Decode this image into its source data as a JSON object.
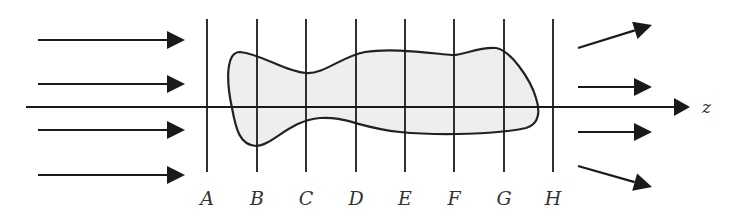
{
  "diagram": {
    "axis": {
      "label": "z",
      "y": 107,
      "x_start": 26,
      "x_end": 690
    },
    "planes": [
      {
        "label": "A",
        "x": 207
      },
      {
        "label": "B",
        "x": 257
      },
      {
        "label": "C",
        "x": 306
      },
      {
        "label": "D",
        "x": 356
      },
      {
        "label": "E",
        "x": 405
      },
      {
        "label": "F",
        "x": 454
      },
      {
        "label": "G",
        "x": 504
      },
      {
        "label": "H",
        "x": 553
      }
    ],
    "plane_top": 19,
    "plane_bottom": 172,
    "label_y": 205,
    "incoming_arrows": [
      {
        "x1": 38,
        "y1": 40,
        "x2": 185,
        "y2": 40
      },
      {
        "x1": 38,
        "y1": 84,
        "x2": 185,
        "y2": 84
      },
      {
        "x1": 38,
        "y1": 130,
        "x2": 185,
        "y2": 130
      },
      {
        "x1": 38,
        "y1": 175,
        "x2": 185,
        "y2": 175
      }
    ],
    "outgoing_arrows": [
      {
        "x1": 578,
        "y1": 48,
        "x2": 652,
        "y2": 25
      },
      {
        "x1": 578,
        "y1": 87,
        "x2": 652,
        "y2": 87
      },
      {
        "x1": 578,
        "y1": 132,
        "x2": 652,
        "y2": 132
      },
      {
        "x1": 578,
        "y1": 166,
        "x2": 652,
        "y2": 187
      }
    ],
    "object": {
      "fill": "#eeeeee",
      "stroke": "#222222",
      "path": "M 240 52 C 226 52, 226 80, 232 108 C 236 130, 240 145, 256 146 C 272 146, 290 120, 320 118 C 345 116, 360 128, 400 132 C 440 136, 500 134, 526 128 C 540 124, 540 110, 536 98 C 530 78, 510 50, 496 48 C 480 46, 462 56, 452 55 C 420 52, 390 48, 365 52 C 340 57, 325 74, 306 73 C 285 72, 262 54, 240 52 Z"
    },
    "colors": {
      "line": "#1a1a1a",
      "background": "#ffffff"
    }
  }
}
